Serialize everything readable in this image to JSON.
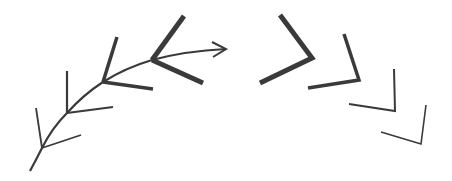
{
  "diagram": {
    "title": "",
    "stroke_color": "#3a3a3a",
    "background_color": "#ffffff",
    "branch_count": 4,
    "chevron_count": 4
  }
}
